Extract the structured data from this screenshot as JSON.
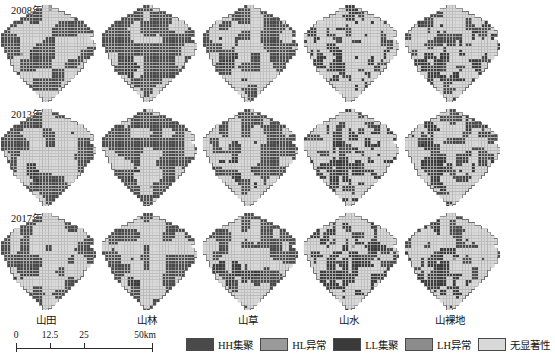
{
  "figure": {
    "title": "",
    "row_labels": [
      "2008年",
      "2013年",
      "2017年"
    ],
    "column_labels": [
      "山田",
      "山林",
      "山草",
      "山水",
      "山裸地"
    ]
  },
  "scalebar": {
    "ticks": [
      "0",
      "12.5",
      "25",
      "50km"
    ],
    "tick_values": [
      0,
      12.5,
      25,
      50
    ],
    "unit": "km"
  },
  "legend": {
    "items": [
      {
        "label": "HH集聚",
        "color": "#4a4a4a",
        "key": "HH"
      },
      {
        "label": "HL异常",
        "color": "#9a9a9a",
        "key": "HL"
      },
      {
        "label": "LL集聚",
        "color": "#3a3a3a",
        "key": "LL"
      },
      {
        "label": "LH异常",
        "color": "#8c8c8c",
        "key": "LH"
      },
      {
        "label": "无显著性",
        "color": "#d9d9d9",
        "key": "NS"
      }
    ]
  },
  "chart_data": {
    "type": "heatmap",
    "title": "",
    "xlabel": "",
    "ylabel": "",
    "rows": [
      "2008年",
      "2013年",
      "2017年"
    ],
    "columns": [
      "山田",
      "山林",
      "山草",
      "山水",
      "山裸地"
    ],
    "categories": [
      "HH集聚",
      "HL异常",
      "LL集聚",
      "LH异常",
      "无显著性"
    ],
    "category_colors": [
      "#4a4a4a",
      "#9a9a9a",
      "#3a3a3a",
      "#8c8c8c",
      "#d9d9d9"
    ],
    "grid": {
      "cols": 30,
      "rows": 31,
      "cell_px": 3.2,
      "gridline_color": "#b8b8b8"
    },
    "panel_share_estimates": [
      {
        "row": "2008年",
        "col": "山田",
        "HH": 0.3,
        "HL": 0.02,
        "LL": 0.1,
        "LH": 0.02,
        "NS": 0.56
      },
      {
        "row": "2008年",
        "col": "山林",
        "HH": 0.26,
        "HL": 0.02,
        "LL": 0.08,
        "LH": 0.02,
        "NS": 0.62
      },
      {
        "row": "2008年",
        "col": "山草",
        "HH": 0.18,
        "HL": 0.02,
        "LL": 0.06,
        "LH": 0.02,
        "NS": 0.72
      },
      {
        "row": "2008年",
        "col": "山水",
        "HH": 0.05,
        "HL": 0.01,
        "LL": 0.03,
        "LH": 0.01,
        "NS": 0.9
      },
      {
        "row": "2008年",
        "col": "山裸地",
        "HH": 0.05,
        "HL": 0.01,
        "LL": 0.03,
        "LH": 0.01,
        "NS": 0.9
      },
      {
        "row": "2013年",
        "col": "山田",
        "HH": 0.31,
        "HL": 0.02,
        "LL": 0.1,
        "LH": 0.02,
        "NS": 0.55
      },
      {
        "row": "2013年",
        "col": "山林",
        "HH": 0.28,
        "HL": 0.02,
        "LL": 0.09,
        "LH": 0.02,
        "NS": 0.59
      },
      {
        "row": "2013年",
        "col": "山草",
        "HH": 0.17,
        "HL": 0.02,
        "LL": 0.06,
        "LH": 0.02,
        "NS": 0.73
      },
      {
        "row": "2013年",
        "col": "山水",
        "HH": 0.07,
        "HL": 0.01,
        "LL": 0.04,
        "LH": 0.01,
        "NS": 0.87
      },
      {
        "row": "2013年",
        "col": "山裸地",
        "HH": 0.09,
        "HL": 0.02,
        "LL": 0.04,
        "LH": 0.01,
        "NS": 0.84
      },
      {
        "row": "2017年",
        "col": "山田",
        "HH": 0.3,
        "HL": 0.02,
        "LL": 0.11,
        "LH": 0.02,
        "NS": 0.55
      },
      {
        "row": "2017年",
        "col": "山林",
        "HH": 0.27,
        "HL": 0.02,
        "LL": 0.1,
        "LH": 0.02,
        "NS": 0.59
      },
      {
        "row": "2017年",
        "col": "山草",
        "HH": 0.16,
        "HL": 0.02,
        "LL": 0.06,
        "LH": 0.02,
        "NS": 0.74
      },
      {
        "row": "2017年",
        "col": "山水",
        "HH": 0.08,
        "HL": 0.01,
        "LL": 0.04,
        "LH": 0.01,
        "NS": 0.86
      },
      {
        "row": "2017年",
        "col": "山裸地",
        "HH": 0.12,
        "HL": 0.02,
        "LL": 0.05,
        "LH": 0.01,
        "NS": 0.8
      }
    ],
    "legend_position": "bottom",
    "grid_on": true
  }
}
